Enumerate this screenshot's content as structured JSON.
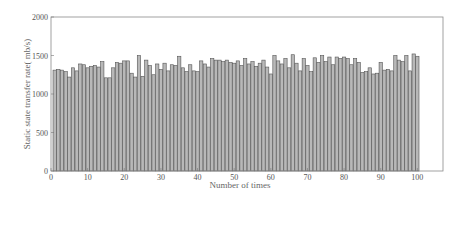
{
  "chart_data": {
    "type": "bar",
    "title": "",
    "xlabel": "Number of times",
    "ylabel": "Static state transfer rate( mb/s)",
    "xlim": [
      0,
      107
    ],
    "ylim": [
      0,
      2000
    ],
    "x_ticks": [
      0,
      10,
      20,
      30,
      40,
      50,
      60,
      70,
      80,
      90,
      100
    ],
    "y_ticks": [
      0,
      500,
      1000,
      1500,
      2000
    ],
    "grid": false,
    "legend": null,
    "bar_color": "#b8b8b8",
    "bar_edge_color": "#555555",
    "categories": [
      1,
      2,
      3,
      4,
      5,
      6,
      7,
      8,
      9,
      10,
      11,
      12,
      13,
      14,
      15,
      16,
      17,
      18,
      19,
      20,
      21,
      22,
      23,
      24,
      25,
      26,
      27,
      28,
      29,
      30,
      31,
      32,
      33,
      34,
      35,
      36,
      37,
      38,
      39,
      40,
      41,
      42,
      43,
      44,
      45,
      46,
      47,
      48,
      49,
      50,
      51,
      52,
      53,
      54,
      55,
      56,
      57,
      58,
      59,
      60,
      61,
      62,
      63,
      64,
      65,
      66,
      67,
      68,
      69,
      70,
      71,
      72,
      73,
      74,
      75,
      76,
      77,
      78,
      79,
      80,
      81,
      82,
      83,
      84,
      85,
      86,
      87,
      88,
      89,
      90,
      91,
      92,
      93,
      94,
      95,
      96,
      97,
      98,
      99,
      100
    ],
    "values": [
      1310,
      1320,
      1310,
      1290,
      1220,
      1340,
      1300,
      1390,
      1380,
      1340,
      1360,
      1370,
      1350,
      1420,
      1210,
      1210,
      1340,
      1410,
      1400,
      1430,
      1430,
      1270,
      1220,
      1500,
      1230,
      1440,
      1370,
      1250,
      1390,
      1320,
      1400,
      1300,
      1380,
      1370,
      1490,
      1340,
      1290,
      1380,
      1300,
      1290,
      1430,
      1390,
      1350,
      1460,
      1440,
      1440,
      1420,
      1440,
      1410,
      1400,
      1430,
      1370,
      1460,
      1390,
      1420,
      1360,
      1400,
      1440,
      1350,
      1260,
      1500,
      1430,
      1390,
      1460,
      1340,
      1510,
      1400,
      1300,
      1460,
      1370,
      1290,
      1470,
      1410,
      1500,
      1420,
      1480,
      1380,
      1480,
      1460,
      1480,
      1460,
      1380,
      1460,
      1410,
      1280,
      1290,
      1340,
      1260,
      1270,
      1410,
      1310,
      1320,
      1300,
      1500,
      1440,
      1420,
      1500,
      1300,
      1520,
      1490
    ]
  },
  "axes": {
    "y_tick_labels": [
      "0",
      "500",
      "1000",
      "1500",
      "2000"
    ],
    "x_tick_labels": [
      "0",
      "10",
      "20",
      "30",
      "40",
      "50",
      "60",
      "70",
      "80",
      "90",
      "100"
    ]
  }
}
